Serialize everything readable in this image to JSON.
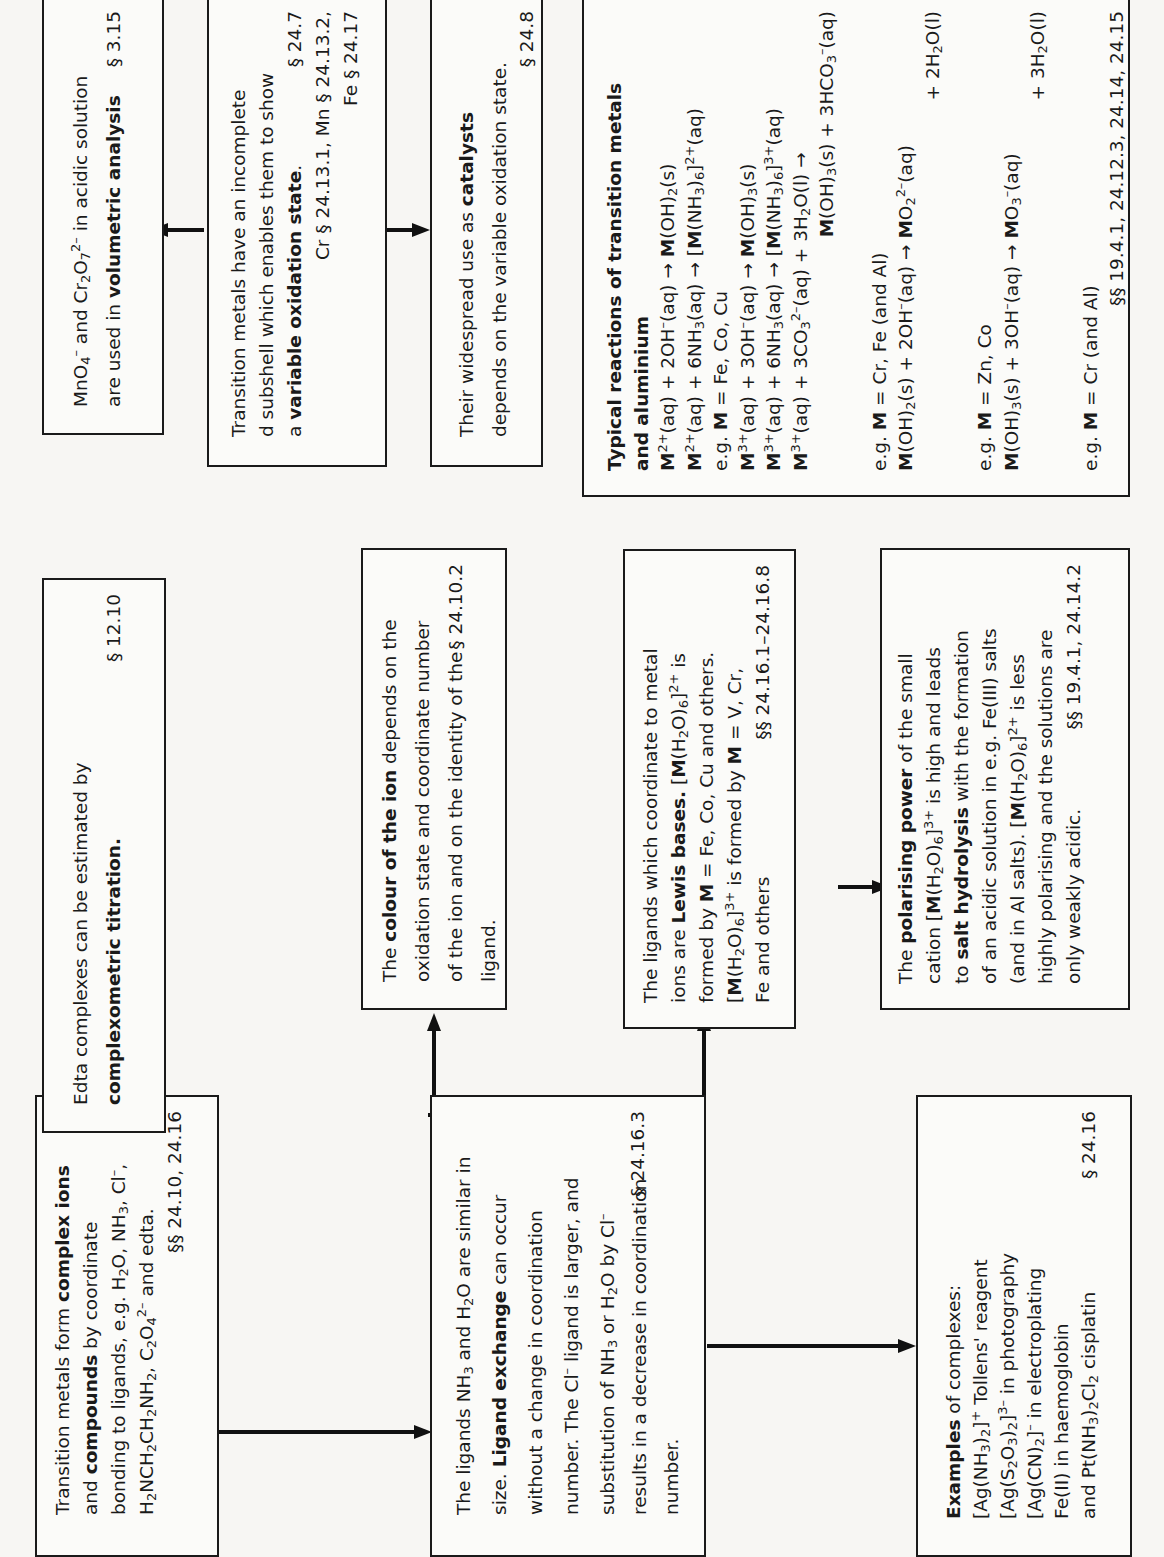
{
  "boxes": {
    "complex_ions": {
      "p1": "Transition metals form ",
      "b1": "complex ions",
      "p2": "and ",
      "b2": "compounds",
      "p3": " by coordinate",
      "p4": "bonding to ligands, e.g. H",
      "p5": "O, NH",
      "p6": ", Cl",
      "p7": ",",
      "p8": "H",
      "p9": "NCH",
      "p10": "CH",
      "p11": "NH",
      "p12": ", C",
      "p13": "O",
      "p14": " and edta.",
      "ref": "§§ 24.10, 24.16"
    },
    "edta": {
      "p1": "Edta complexes can be estimated by",
      "b1": "complexometric titration.",
      "ref": "§ 12.10"
    },
    "volumetric": {
      "p1": "MnO",
      "p2": " and Cr",
      "p3": "O",
      "p4": " in acidic solution",
      "p5": "are used in ",
      "b1": "volumetric analysis",
      "ref": "§ 3.15"
    },
    "oxidation_state": {
      "p1": "Transition metals have an incomplete",
      "p2": "d subshell which enables them to show",
      "p3": "a ",
      "b1": "variable oxidation state",
      "p4": ".",
      "ref1": "§ 24.7",
      "ref2": "Cr § 24.13.1, Mn § 24.13.2,",
      "ref3": "Fe § 24.17"
    },
    "catalysts": {
      "p1": "Their widespread use as ",
      "b1": "catalysts",
      "p2": "depends on the variable oxidation state.",
      "ref": "§ 24.8"
    },
    "colour": {
      "p1": "The ",
      "b1": "colour of the ion",
      "p2": " depends on the",
      "p3": "oxidation state and coordinate number",
      "p4": "of the ion and on the identity of the",
      "p5": "ligand.",
      "ref": "§ 24.10.2"
    },
    "lewis": {
      "p1": "The ligands which coordinate to metal",
      "p2": "ions are ",
      "b1": "Lewis bases.",
      "p3": " [",
      "p4": "(H",
      "p5": "O)",
      "p6": "]",
      "p7": " is",
      "p8": "formed by ",
      "p9": " = Fe, Co, Cu and others.",
      "p10": "[",
      "p11": "(H",
      "p12": "O)",
      "p13": "]",
      "p14": " is formed by ",
      "p15": " = V, Cr,",
      "p16": "Fe and others",
      "ref": "§§ 24.16.1–24.16.8"
    },
    "polarising": {
      "p1": "The ",
      "b1": "polarising power",
      "p2": " of the small",
      "p3": "cation [",
      "p4": "(H",
      "p5": "O)",
      "p6": "]",
      "p7": " is high and leads",
      "p8": "to ",
      "b2": "salt hydrolysis",
      "p9": " with the formation",
      "p10": "of an acidic solution in e.g. Fe(III) salts",
      "p11": "(and in Al salts). [",
      "p12": "(H",
      "p13": "O)",
      "p14": "]",
      "p15": " is less",
      "p16": "highly polarising and the solutions are",
      "p17": "only weakly acidic.",
      "ref": "§§ 19.4.1, 24.14.2"
    },
    "ligand_exchange": {
      "p1": "The ligands NH",
      "p2": " and H",
      "p3": "O are similar in",
      "p4": "size. ",
      "b1": "Ligand exchange",
      "p5": " can occur",
      "p6": "without a change in coordination",
      "p7": "number. The Cl",
      "p8": " ligand is larger, and",
      "p9": "substitution of NH",
      "p10": " or H",
      "p11": "O by Cl",
      "p12": "results in a decrease in coordination",
      "p13": "number.",
      "ref": "§ 24.16.3"
    },
    "examples": {
      "b1": "Examples",
      "p1": " of complexes:",
      "l1a": "[Ag(NH",
      "l1b": ")",
      "l1c": "]",
      "l1d": " Tollens' reagent",
      "l2a": "[Ag(S",
      "l2b": "O",
      "l2c": ")",
      "l2d": "]",
      "l2e": " in photography",
      "l3a": "[Ag(CN)",
      "l3b": "]",
      "l3c": " in electroplating",
      "l4": "Fe(II) in haemoglobin",
      "l5a": "and Pt(NH",
      "l5b": ")",
      "l5c": "Cl",
      "l5d": " cisplatin",
      "ref": "§ 24.16"
    },
    "reactions": {
      "title1": "Typical reactions of transition metals",
      "title2": "and aluminium",
      "M": "M",
      "eg": "e.g. ",
      "eq1a": "(aq) + 2OH",
      "eq1b": "(aq) → ",
      "eq1c": "(OH)",
      "eq1d": "(s)",
      "eq2a": "(aq) + 6NH",
      "eq2b": "(aq) → [",
      "eq2c": "(NH",
      "eq2d": ")",
      "eq2e": "]",
      "eq2f": "(aq)",
      "eg1": " = Fe, Co, Cu",
      "eq3a": "(aq) + 3OH",
      "eq3b": "(aq) → ",
      "eq3c": "(OH)",
      "eq3d": "(s)",
      "eq4a": "(aq) + 6NH",
      "eq4b": "(aq) → [",
      "eq4c": "(NH",
      "eq4d": ")",
      "eq4e": "]",
      "eq4f": "(aq)",
      "eq5a": "(aq) + 3CO",
      "eq5b": "(aq) + 3H",
      "eq5c": "O(l) →",
      "eq5d": "(OH)",
      "eq5e": "(s) + 3HCO",
      "eq5f": "(aq)",
      "eg2": " = Cr, Fe (and Al)",
      "eq6a": "(OH)",
      "eq6b": "(s) + 2OH",
      "eq6c": "(aq) → ",
      "eq6d": "O",
      "eq6e": "(aq)",
      "eq6f": "+ 2H",
      "eq6g": "O(l)",
      "eg3": " = Zn, Co",
      "eq7a": "(OH)",
      "eq7b": "(s) + 3OH",
      "eq7c": "(aq) → ",
      "eq7d": "O",
      "eq7e": "(aq)",
      "eq7f": "+ 3H",
      "eq7g": "O(l)",
      "eg4": " = Cr (and Al)",
      "ref": "§§ 19.4.1, 24.12.3, 24.14, 24.15"
    }
  },
  "sub": {
    "2": "2",
    "3": "3",
    "4": "4",
    "6": "6",
    "7": "7"
  },
  "sup": {
    "minus": "–",
    "2minus": "2–",
    "3minus": "3–",
    "plus": "+",
    "2plus": "2+",
    "3plus": "3+"
  }
}
